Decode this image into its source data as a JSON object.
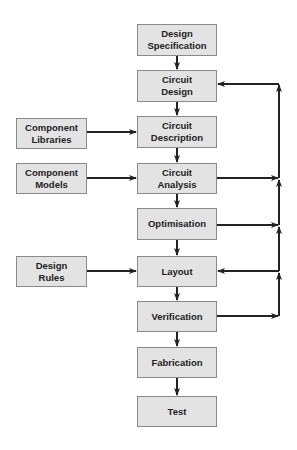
{
  "diagram": {
    "main_flow": [
      {
        "id": "design_spec",
        "label": "Design\nSpecification"
      },
      {
        "id": "circuit_design",
        "label": "Circuit\nDesign"
      },
      {
        "id": "circuit_description",
        "label": "Circuit\nDescription"
      },
      {
        "id": "circuit_analysis",
        "label": "Circuit\nAnalysis"
      },
      {
        "id": "optimisation",
        "label": "Optimisation"
      },
      {
        "id": "layout",
        "label": "Layout"
      },
      {
        "id": "verification",
        "label": "Verification"
      },
      {
        "id": "fabrication",
        "label": "Fabrication"
      },
      {
        "id": "test",
        "label": "Test"
      }
    ],
    "inputs": [
      {
        "id": "component_libraries",
        "label": "Component\nLibraries",
        "target": "circuit_description"
      },
      {
        "id": "component_models",
        "label": "Component\nModels",
        "target": "circuit_analysis"
      },
      {
        "id": "design_rules",
        "label": "Design\nRules",
        "target": "layout"
      }
    ],
    "feedback": {
      "sources": [
        "circuit_analysis",
        "optimisation",
        "verification"
      ],
      "targets": [
        "circuit_design",
        "layout"
      ]
    }
  }
}
